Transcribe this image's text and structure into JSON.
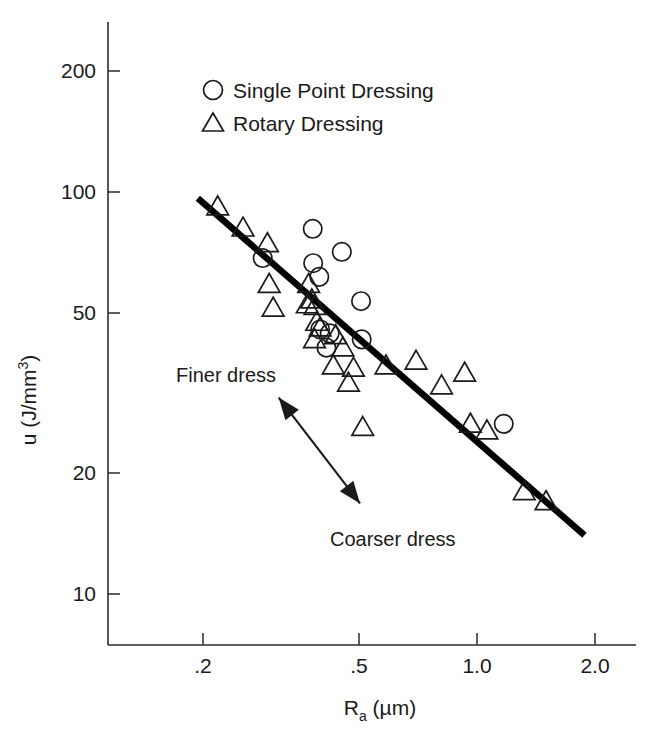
{
  "chart_data": {
    "type": "scatter",
    "title": "",
    "xlabel": "R_a (um)",
    "xlabel_main": "R",
    "xlabel_sub": "a",
    "xlabel_unit": " (µm)",
    "ylabel": "u (J/mm3)",
    "ylabel_main": "u (J/mm",
    "ylabel_sup": "3",
    "ylabel_close": ")",
    "xscale": "log",
    "yscale": "log",
    "xlim": [
      0.15,
      2.3
    ],
    "ylim": [
      8.2,
      260
    ],
    "grid": false,
    "xticks": [
      0.2,
      0.5,
      1.0,
      2.0
    ],
    "xticklabels": [
      ".2",
      ".5",
      "1.0",
      "2.0"
    ],
    "yticks": [
      10,
      20,
      50,
      100,
      200
    ],
    "yticklabels": [
      "10",
      "20",
      "50",
      "100",
      "200"
    ],
    "legend_position": "upper-center",
    "series": [
      {
        "name": "Single Point Dressing",
        "marker": "circle",
        "points": [
          [
            0.284,
            68.5
          ],
          [
            0.381,
            81.0
          ],
          [
            0.382,
            66.5
          ],
          [
            0.396,
            61.5
          ],
          [
            0.452,
            71.0
          ],
          [
            0.398,
            45.5
          ],
          [
            0.413,
            41.0
          ],
          [
            0.421,
            44.5
          ],
          [
            0.506,
            53.5
          ],
          [
            0.508,
            43.0
          ],
          [
            1.17,
            26.5
          ]
        ]
      },
      {
        "name": "Rotary Dressing",
        "marker": "triangle",
        "points": [
          [
            0.218,
            92.0
          ],
          [
            0.253,
            81.5
          ],
          [
            0.292,
            74.5
          ],
          [
            0.295,
            59.0
          ],
          [
            0.302,
            51.5
          ],
          [
            0.372,
            59.0
          ],
          [
            0.379,
            54.0
          ],
          [
            0.369,
            52.5
          ],
          [
            0.386,
            52.0
          ],
          [
            0.39,
            47.5
          ],
          [
            0.398,
            46.0
          ],
          [
            0.385,
            43.0
          ],
          [
            0.436,
            44.0
          ],
          [
            0.455,
            41.0
          ],
          [
            0.43,
            37.0
          ],
          [
            0.484,
            36.5
          ],
          [
            0.47,
            33.5
          ],
          [
            0.511,
            26.0
          ],
          [
            0.586,
            37.0
          ],
          [
            0.699,
            38.0
          ],
          [
            0.812,
            33.0
          ],
          [
            0.93,
            35.5
          ],
          [
            0.962,
            26.5
          ],
          [
            1.06,
            25.5
          ],
          [
            1.32,
            18.0
          ],
          [
            1.5,
            17.0
          ]
        ]
      }
    ],
    "trendline": {
      "label": "fit",
      "x_start": 0.194,
      "y_start": 96.5,
      "x_end": 1.88,
      "y_end": 14.0
    },
    "annotations": [
      {
        "name": "finer-dress",
        "text": "Finer dress"
      },
      {
        "name": "coarser-dress",
        "text": "Coarser dress"
      }
    ],
    "arrow": {
      "name": "dress-direction-arrow",
      "double_headed": true,
      "from": [
        0.312,
        30.8
      ],
      "to": [
        0.503,
        16.8
      ]
    }
  },
  "legend": {
    "items": [
      {
        "marker": "circle",
        "label": "Single Point Dressing"
      },
      {
        "marker": "triangle",
        "label": "Rotary Dressing"
      }
    ]
  },
  "colors": {
    "ink": "#1a1a1a",
    "line": "#000000",
    "background": "#ffffff"
  }
}
